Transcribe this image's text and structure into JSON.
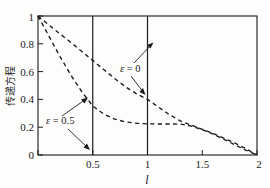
{
  "chart_data": {
    "type": "line",
    "title": "",
    "xlabel": "l",
    "ylabel": "传递方程",
    "xlim": [
      0,
      2
    ],
    "ylim": [
      0,
      1
    ],
    "grid": false,
    "legend_position": "inline-annotations",
    "xticks": [
      "0",
      "0.5",
      "1",
      "1.5",
      "2"
    ],
    "xtick_values": [
      0,
      0.5,
      1,
      1.5,
      2
    ],
    "yticks": [
      "0",
      "0.2",
      "0.4",
      "0.6",
      "0.8",
      "1"
    ],
    "ytick_values": [
      0,
      0.2,
      0.4,
      0.6,
      0.8,
      1
    ],
    "linestyle": "dashed",
    "series": [
      {
        "name": "ε = 0",
        "label": "ε = 0",
        "style": "dashed",
        "x": [
          0,
          0.1,
          0.2,
          0.3,
          0.4,
          0.5,
          0.6,
          0.7,
          0.8,
          0.9,
          1.0,
          1.1,
          1.2,
          1.3,
          1.4,
          1.5,
          1.6,
          1.7,
          1.8,
          1.9,
          2.0
        ],
        "values": [
          1.0,
          0.935,
          0.872,
          0.81,
          0.745,
          0.68,
          0.615,
          0.55,
          0.49,
          0.44,
          0.4,
          0.345,
          0.29,
          0.245,
          0.215,
          0.185,
          0.155,
          0.12,
          0.085,
          0.045,
          0.0
        ]
      },
      {
        "name": "ε = 0.5",
        "label": "ε = 0.5",
        "style": "dashed",
        "x": [
          0,
          0.1,
          0.2,
          0.3,
          0.4,
          0.5,
          0.6,
          0.7,
          0.8,
          0.9,
          1.0,
          1.1,
          1.2,
          1.3,
          1.4,
          1.5,
          1.6,
          1.7,
          1.8,
          1.9,
          2.0
        ],
        "values": [
          1.0,
          0.855,
          0.71,
          0.575,
          0.455,
          0.352,
          0.295,
          0.258,
          0.238,
          0.228,
          0.224,
          0.223,
          0.223,
          0.222,
          0.208,
          0.182,
          0.15,
          0.112,
          0.072,
          0.034,
          0.0
        ]
      }
    ],
    "reference_lines": [
      {
        "name": "vline-0.5",
        "orientation": "vertical",
        "value": 0.5
      },
      {
        "name": "vline-1",
        "orientation": "vertical",
        "value": 1
      }
    ],
    "annotations": [
      {
        "name": "epsilon-zero",
        "text_symbol": "ε",
        "text_rest": " = 0",
        "text": "ε = 0",
        "text_x": 0.75,
        "text_y": 0.63,
        "arrows": [
          {
            "to_x": 1.0,
            "to_y": 0.85,
            "from_x": 0.88,
            "from_y": 0.7
          },
          {
            "to_x": 0.93,
            "to_y": 0.44,
            "from_x": 0.85,
            "from_y": 0.58
          }
        ]
      },
      {
        "name": "epsilon-half",
        "text_symbol": "ε",
        "text_rest": " = 0.5",
        "text": "ε = 0.5",
        "text_x": 0.17,
        "text_y": 0.245,
        "arrows": [
          {
            "to_x": 0.455,
            "to_y": 0.415,
            "from_x": 0.285,
            "from_y": 0.3
          },
          {
            "to_x": 0.49,
            "to_y": 0.055,
            "from_x": 0.33,
            "from_y": 0.195
          }
        ]
      }
    ]
  },
  "axes": {
    "y_label": "传递方程",
    "x_label": "l",
    "x_tick_labels": [
      "0",
      "0.5",
      "1",
      "1.5",
      "2"
    ],
    "y_tick_labels": [
      "0",
      "0.2",
      "0.4",
      "0.6",
      "0.8",
      "1"
    ]
  },
  "colors": {
    "background": "#fdfdfc",
    "axis": "#1a1a1a",
    "curve": "#1a1a1a"
  }
}
